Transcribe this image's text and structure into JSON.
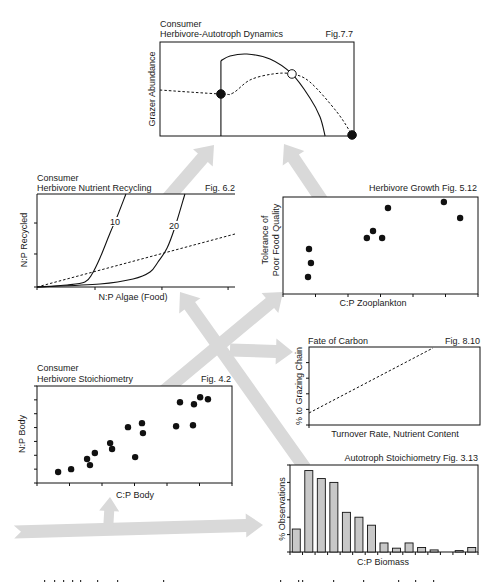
{
  "figure": {
    "panels": {
      "dynamics": {
        "title_line1": "Consumer",
        "title_line2": "Herbivore-Autotroph Dynamics",
        "fig": "Fig.7.7",
        "ylabel": "Grazer Abundance"
      },
      "recycling": {
        "title_line1": "Consumer",
        "title_line2": "Herbivore Nutrient Recycling",
        "fig": "Fig. 6.2",
        "ylabel": "N:P Recycled",
        "xlabel": "N:P Algae (Food)",
        "curve_labels": [
          "10",
          "20"
        ]
      },
      "growth": {
        "title": "Herbivore Growth Fig. 5.12",
        "ylabel_line1": "Tolerance of",
        "ylabel_line2": "Poor Food Quality",
        "xlabel": "C:P Zooplankton"
      },
      "carbon": {
        "title": "Fate of Carbon",
        "fig": "Fig. 8.10",
        "ylabel": "% to Grazing Chain",
        "xlabel": "Turnover Rate, Nutrient Content"
      },
      "stoichiometry": {
        "title_line1": "Consumer",
        "title_line2": "Herbivore Stoichiometry",
        "fig": "Fig. 4.2",
        "ylabel": "N:P Body",
        "xlabel": "C:P Body"
      },
      "histogram": {
        "title": "Autotroph Stoichiometry Fig. 3.13",
        "ylabel": "% Observations",
        "xlabel": "C:P Biomass"
      }
    }
  },
  "colors": {
    "arrow": "#d9d9d9",
    "bar_fill": "#c8c8c8",
    "ink": "#111111",
    "background": "#ffffff"
  },
  "chart_data": [
    {
      "panel": "dynamics",
      "type": "line",
      "title": "Consumer Herbivore-Autotroph Dynamics (Fig.7.7)",
      "xlabel": "",
      "ylabel": "Grazer Abundance",
      "xlim": [
        0,
        1
      ],
      "ylim": [
        0,
        1
      ],
      "grid": false,
      "series": [
        {
          "name": "solid vertical",
          "style": "solid",
          "straight": true,
          "points": [
            [
              0.314,
              0
            ],
            [
              0.314,
              0.8
            ]
          ]
        },
        {
          "name": "solid hump",
          "style": "solid",
          "points": [
            [
              0.314,
              0.8
            ],
            [
              0.361,
              0.851
            ],
            [
              0.448,
              0.872
            ],
            [
              0.567,
              0.819
            ],
            [
              0.68,
              0.66
            ],
            [
              0.773,
              0.404
            ],
            [
              0.825,
              0.202
            ],
            [
              0.851,
              0
            ]
          ]
        },
        {
          "name": "dashed trajectory",
          "style": "dashed",
          "points": [
            [
              0,
              0.489
            ],
            [
              0.314,
              0.447
            ],
            [
              0.376,
              0.457
            ],
            [
              0.464,
              0.596
            ],
            [
              0.582,
              0.66
            ],
            [
              0.68,
              0.66
            ],
            [
              0.773,
              0.574
            ],
            [
              0.912,
              0.255
            ],
            [
              0.99,
              0.011
            ]
          ]
        }
      ],
      "markers": [
        {
          "x": 0.314,
          "y": 0.447,
          "style": "filled"
        },
        {
          "x": 0.68,
          "y": 0.66,
          "style": "open"
        },
        {
          "x": 0.99,
          "y": 0.011,
          "style": "filled"
        }
      ]
    },
    {
      "panel": "recycling",
      "type": "line",
      "title": "Consumer Herbivore Nutrient Recycling (Fig. 6.2)",
      "xlabel": "N:P Algae (Food)",
      "ylabel": "N:P Recycled",
      "xlim": [
        0,
        1
      ],
      "ylim": [
        0,
        1
      ],
      "xticks": [
        0,
        0.293,
        0.631,
        0.965
      ],
      "yticks": [
        0,
        0.355,
        0.688
      ],
      "grid": false,
      "series": [
        {
          "name": "10",
          "style": "solid",
          "points": [
            [
              0,
              0
            ],
            [
              0.152,
              0.022
            ],
            [
              0.242,
              0.054
            ],
            [
              0.278,
              0.14
            ],
            [
              0.318,
              0.312
            ],
            [
              0.369,
              0.581
            ],
            [
              0.404,
              0.753
            ],
            [
              0.449,
              1.0
            ]
          ]
        },
        {
          "name": "20",
          "style": "solid",
          "points": [
            [
              0,
              0
            ],
            [
              0.318,
              0.032
            ],
            [
              0.485,
              0.086
            ],
            [
              0.571,
              0.161
            ],
            [
              0.611,
              0.269
            ],
            [
              0.657,
              0.419
            ],
            [
              0.697,
              0.645
            ],
            [
              0.747,
              1.0
            ]
          ]
        },
        {
          "name": "1:1 reference",
          "style": "dashed",
          "straight": true,
          "points": [
            [
              0,
              0
            ],
            [
              1,
              0.57
            ]
          ]
        }
      ]
    },
    {
      "panel": "growth",
      "type": "scatter",
      "title": "Herbivore Growth Fig. 5.12",
      "xlabel": "C:P Zooplankton",
      "ylabel": "Tolerance of Poor Food Quality",
      "xlim": [
        0,
        6
      ],
      "ylim": [
        0,
        10
      ],
      "xticks": [
        0,
        1,
        2,
        3,
        4,
        5,
        6
      ],
      "grid": false,
      "points": [
        [
          0.77,
          1.75
        ],
        [
          0.86,
          3.2
        ],
        [
          0.8,
          4.64
        ],
        [
          2.58,
          5.77
        ],
        [
          2.77,
          6.49
        ],
        [
          3.05,
          5.77
        ],
        [
          3.23,
          8.87
        ],
        [
          4.95,
          9.48
        ],
        [
          5.45,
          7.84
        ]
      ]
    },
    {
      "panel": "carbon",
      "type": "line",
      "title": "Fate of Carbon (Fig. 8.10)",
      "xlabel": "Turnover Rate, Nutrient Content",
      "ylabel": "% to Grazing Chain",
      "xlim": [
        0,
        1
      ],
      "ylim": [
        0,
        1
      ],
      "yticks": [
        0,
        0.2,
        0.4,
        0.6,
        0.8
      ],
      "xticks": [
        0
      ],
      "grid": false,
      "series": [
        {
          "name": "trend",
          "style": "dashed",
          "straight": true,
          "points": [
            [
              0,
              0.154
            ],
            [
              0.725,
              0.987
            ]
          ]
        }
      ]
    },
    {
      "panel": "stoichiometry",
      "type": "scatter",
      "title": "Consumer Herbivore Stoichiometry (Fig. 4.2)",
      "xlabel": "C:P Body",
      "ylabel": "N:P Body",
      "xlim": [
        0,
        6
      ],
      "ylim": [
        0,
        7
      ],
      "xticks": [
        0,
        1,
        2,
        3,
        4,
        5,
        6
      ],
      "yticks": [
        0,
        1,
        2,
        3,
        4,
        5,
        6,
        7
      ],
      "grid": false,
      "points": [
        [
          0.65,
          0.79
        ],
        [
          1.05,
          1.0
        ],
        [
          1.54,
          1.73
        ],
        [
          1.63,
          1.29
        ],
        [
          1.78,
          2.16
        ],
        [
          2.25,
          2.88
        ],
        [
          2.31,
          2.45
        ],
        [
          2.8,
          4.03
        ],
        [
          3.02,
          1.87
        ],
        [
          3.23,
          4.32
        ],
        [
          3.26,
          3.6
        ],
        [
          4.28,
          4.1
        ],
        [
          4.4,
          5.83
        ],
        [
          4.8,
          4.17
        ],
        [
          4.83,
          5.68
        ],
        [
          5.02,
          6.19
        ],
        [
          5.26,
          6.04
        ]
      ]
    },
    {
      "panel": "histogram",
      "type": "bar",
      "title": "Autotroph Stoichiometry Fig. 3.13",
      "xlabel": "C:P Biomass",
      "ylabel": "% Observations",
      "categories": [
        "bin1",
        "bin2",
        "bin3",
        "bin4",
        "bin5",
        "bin6",
        "bin7",
        "bin8",
        "bin9",
        "bin10",
        "bin11",
        "bin12",
        "bin13",
        "bin14",
        "bin15"
      ],
      "values": [
        6.6,
        23.4,
        21.1,
        20.0,
        11.4,
        10.0,
        7.7,
        2.6,
        1.1,
        2.6,
        1.3,
        0.6,
        0,
        0.4,
        1.3
      ],
      "ylim": [
        0,
        25
      ],
      "yticks": [
        0,
        5,
        10,
        15,
        20,
        25
      ],
      "bin_edge_ticks": true,
      "grid": false
    }
  ]
}
